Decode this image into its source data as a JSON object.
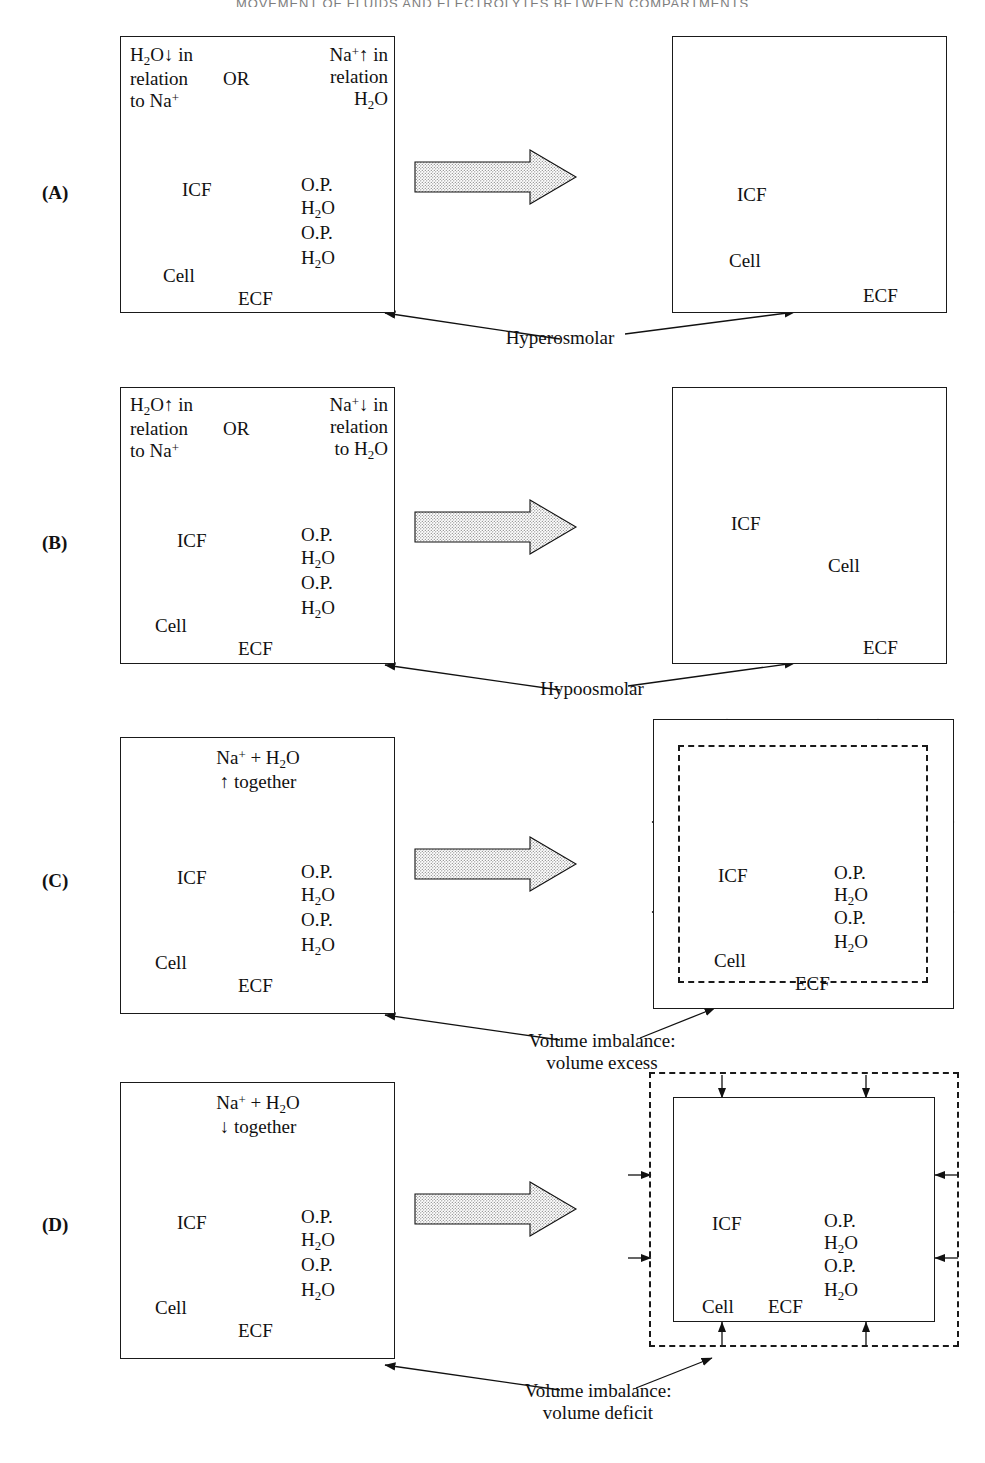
{
  "header": {
    "title": "MOVEMENT OF FLUIDS AND ELECTROLYTES BETWEEN COMPARTMENTS"
  },
  "common": {
    "icf": "ICF",
    "ecf": "ECF",
    "cell": "Cell",
    "op": "O.P.",
    "h2o_plain": "H2O",
    "or": "OR",
    "arrow_icon": "block-arrow-right"
  },
  "panels": [
    {
      "id": "A",
      "letter": "(A)",
      "caption": "Hyperosmolar",
      "left": {
        "cause_left_lines": [
          "H2O↓ in",
          "relation",
          "to Na+"
        ],
        "connector": "OR",
        "cause_right_lines": [
          "Na+↑ in",
          "relation",
          "H2O"
        ],
        "flow_labels": [
          "O.P.",
          "H2O",
          "O.P.",
          "H2O"
        ],
        "flow_directions": [
          "out",
          "out",
          "in",
          "in"
        ],
        "cell_label": "Cell",
        "icf_label": "ICF",
        "ecf_label": "ECF"
      },
      "right": {
        "cell_shape": "crenated",
        "icf_label": "ICF",
        "cell_label": "Cell",
        "ecf_label": "ECF"
      }
    },
    {
      "id": "B",
      "letter": "(B)",
      "caption": "Hypoosmolar",
      "left": {
        "cause_left_lines": [
          "H2O↑ in",
          "relation",
          "to Na+"
        ],
        "connector": "OR",
        "cause_right_lines": [
          "Na+↓ in",
          "relation",
          "to H2O"
        ],
        "flow_labels": [
          "O.P.",
          "H2O",
          "O.P.",
          "H2O"
        ],
        "flow_directions": [
          "in",
          "in",
          "out",
          "out"
        ],
        "cell_label": "Cell",
        "icf_label": "ICF",
        "ecf_label": "ECF"
      },
      "right": {
        "cell_shape": "swollen-round",
        "icf_label": "ICF",
        "cell_label": "Cell",
        "ecf_label": "ECF"
      }
    },
    {
      "id": "C",
      "letter": "(C)",
      "caption_line1": "Volume imbalance:",
      "caption_line2": "volume excess",
      "left": {
        "cause_line1": "Na+ + H2O",
        "cause_line2": "↑ together",
        "flow_labels": [
          "O.P.",
          "H2O",
          "O.P.",
          "H2O"
        ],
        "flow_directions": [
          "out",
          "out",
          "in",
          "in"
        ],
        "cell_label": "Cell",
        "icf_label": "ICF",
        "ecf_label": "ECF"
      },
      "right": {
        "change": "expanded",
        "outer_style": "solid",
        "inner_style": "dashed",
        "boundary_arrows": "outward",
        "icf_label": "ICF",
        "cell_label": "Cell",
        "ecf_label": "ECF",
        "flow_labels": [
          "O.P.",
          "H2O",
          "O.P.",
          "H2O"
        ],
        "flow_directions": [
          "out",
          "out",
          "in",
          "in"
        ]
      }
    },
    {
      "id": "D",
      "letter": "(D)",
      "caption_line1": "Volume imbalance:",
      "caption_line2": "volume deficit",
      "left": {
        "cause_line1": "Na+ + H2O",
        "cause_line2": "↓ together",
        "flow_labels": [
          "O.P.",
          "H2O",
          "O.P.",
          "H2O"
        ],
        "flow_directions": [
          "out",
          "out",
          "in",
          "in"
        ],
        "cell_label": "Cell",
        "icf_label": "ICF",
        "ecf_label": "ECF"
      },
      "right": {
        "change": "contracted",
        "outer_style": "dashed",
        "inner_style": "solid",
        "boundary_arrows": "inward",
        "icf_label": "ICF",
        "cell_label": "Cell",
        "ecf_label": "ECF",
        "flow_labels": [
          "O.P.",
          "H2O",
          "O.P.",
          "H2O"
        ],
        "flow_directions": [
          "out",
          "out",
          "in",
          "in"
        ]
      }
    }
  ]
}
